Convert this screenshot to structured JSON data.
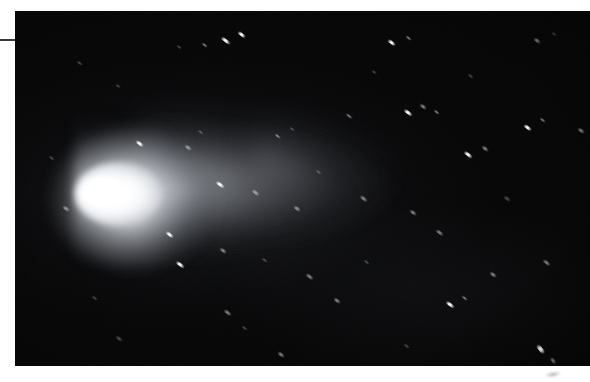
{
  "document": {
    "type": "photograph",
    "subject": "comet",
    "description": "Astronomical photograph of a bright comet with a white coma and a long dust tail extending to the right against a black star field, printed with a white page margin.",
    "background_color": "#ffffff",
    "photo_background_color": "#050506"
  },
  "page": {
    "margin_rule": {
      "label": "",
      "color": "#3a3a3a"
    },
    "corner_smudge": {
      "label": ""
    }
  },
  "photo": {
    "frame": {
      "left": 15,
      "top": 11,
      "width": 575,
      "height": 355
    },
    "comet": {
      "coma_label": "",
      "nucleus_label": "",
      "tail_label": "",
      "coma_color": "#ffffff",
      "tail_color": "#b9bcc3",
      "sky_color": "#050506"
    },
    "stars": [
      {
        "x": 205,
        "y": 28,
        "w": 11,
        "h": 3,
        "rot": 37,
        "cls": ""
      },
      {
        "x": 222,
        "y": 22,
        "w": 9,
        "h": 3,
        "rot": 37,
        "cls": ""
      },
      {
        "x": 186,
        "y": 33,
        "w": 7,
        "h": 2,
        "rot": 37,
        "cls": "dim"
      },
      {
        "x": 161,
        "y": 35,
        "w": 6,
        "h": 2,
        "rot": 37,
        "cls": "faint"
      },
      {
        "x": 372,
        "y": 30,
        "w": 9,
        "h": 3,
        "rot": 37,
        "cls": ""
      },
      {
        "x": 390,
        "y": 26,
        "w": 7,
        "h": 2,
        "rot": 37,
        "cls": "dim"
      },
      {
        "x": 518,
        "y": 28,
        "w": 8,
        "h": 3,
        "rot": 37,
        "cls": "dim"
      },
      {
        "x": 536,
        "y": 22,
        "w": 6,
        "h": 2,
        "rot": 37,
        "cls": "faint"
      },
      {
        "x": 61,
        "y": 51,
        "w": 7,
        "h": 2,
        "rot": 37,
        "cls": "faint"
      },
      {
        "x": 100,
        "y": 74,
        "w": 6,
        "h": 2,
        "rot": 37,
        "cls": "faint"
      },
      {
        "x": 388,
        "y": 100,
        "w": 10,
        "h": 3,
        "rot": 37,
        "cls": ""
      },
      {
        "x": 404,
        "y": 94,
        "w": 8,
        "h": 3,
        "rot": 37,
        "cls": "dim"
      },
      {
        "x": 418,
        "y": 100,
        "w": 7,
        "h": 2,
        "rot": 37,
        "cls": "dim"
      },
      {
        "x": 508,
        "y": 115,
        "w": 9,
        "h": 3,
        "rot": 37,
        "cls": ""
      },
      {
        "x": 524,
        "y": 108,
        "w": 7,
        "h": 2,
        "rot": 37,
        "cls": "dim"
      },
      {
        "x": 562,
        "y": 118,
        "w": 8,
        "h": 3,
        "rot": 37,
        "cls": "dim"
      },
      {
        "x": 120,
        "y": 131,
        "w": 9,
        "h": 3,
        "rot": 37,
        "cls": ""
      },
      {
        "x": 169,
        "y": 135,
        "w": 8,
        "h": 3,
        "rot": 37,
        "cls": "dim"
      },
      {
        "x": 182,
        "y": 120,
        "w": 7,
        "h": 2,
        "rot": 37,
        "cls": "faint"
      },
      {
        "x": 259,
        "y": 124,
        "w": 7,
        "h": 2,
        "rot": 37,
        "cls": "dim"
      },
      {
        "x": 274,
        "y": 117,
        "w": 6,
        "h": 2,
        "rot": 37,
        "cls": "faint"
      },
      {
        "x": 330,
        "y": 104,
        "w": 8,
        "h": 2,
        "rot": 37,
        "cls": "dim"
      },
      {
        "x": 448,
        "y": 142,
        "w": 10,
        "h": 3,
        "rot": 37,
        "cls": ""
      },
      {
        "x": 466,
        "y": 136,
        "w": 8,
        "h": 3,
        "rot": 37,
        "cls": "dim"
      },
      {
        "x": 200,
        "y": 172,
        "w": 10,
        "h": 3,
        "rot": 37,
        "cls": ""
      },
      {
        "x": 236,
        "y": 180,
        "w": 9,
        "h": 3,
        "rot": 37,
        "cls": "dim"
      },
      {
        "x": 278,
        "y": 196,
        "w": 8,
        "h": 3,
        "rot": 37,
        "cls": "dim"
      },
      {
        "x": 300,
        "y": 160,
        "w": 7,
        "h": 2,
        "rot": 37,
        "cls": "faint"
      },
      {
        "x": 344,
        "y": 186,
        "w": 9,
        "h": 3,
        "rot": 37,
        "cls": "dim"
      },
      {
        "x": 394,
        "y": 200,
        "w": 8,
        "h": 3,
        "rot": 37,
        "cls": "dim"
      },
      {
        "x": 420,
        "y": 220,
        "w": 9,
        "h": 3,
        "rot": 37,
        "cls": "dim"
      },
      {
        "x": 488,
        "y": 186,
        "w": 8,
        "h": 3,
        "rot": 37,
        "cls": "faint"
      },
      {
        "x": 150,
        "y": 222,
        "w": 9,
        "h": 3,
        "rot": 37,
        "cls": ""
      },
      {
        "x": 160,
        "y": 252,
        "w": 10,
        "h": 3,
        "rot": 37,
        "cls": ""
      },
      {
        "x": 204,
        "y": 238,
        "w": 8,
        "h": 3,
        "rot": 37,
        "cls": "dim"
      },
      {
        "x": 246,
        "y": 248,
        "w": 7,
        "h": 2,
        "rot": 37,
        "cls": "faint"
      },
      {
        "x": 290,
        "y": 264,
        "w": 9,
        "h": 3,
        "rot": 37,
        "cls": "dim"
      },
      {
        "x": 318,
        "y": 288,
        "w": 8,
        "h": 3,
        "rot": 37,
        "cls": "dim"
      },
      {
        "x": 348,
        "y": 250,
        "w": 7,
        "h": 2,
        "rot": 37,
        "cls": "faint"
      },
      {
        "x": 430,
        "y": 292,
        "w": 10,
        "h": 3,
        "rot": 37,
        "cls": ""
      },
      {
        "x": 446,
        "y": 286,
        "w": 7,
        "h": 2,
        "rot": 37,
        "cls": "dim"
      },
      {
        "x": 474,
        "y": 262,
        "w": 8,
        "h": 3,
        "rot": 37,
        "cls": "dim"
      },
      {
        "x": 527,
        "y": 250,
        "w": 9,
        "h": 3,
        "rot": 37,
        "cls": "dim"
      },
      {
        "x": 520,
        "y": 336,
        "w": 11,
        "h": 4,
        "rot": 50,
        "cls": ""
      },
      {
        "x": 534,
        "y": 348,
        "w": 8,
        "h": 3,
        "rot": 50,
        "cls": "dim"
      },
      {
        "x": 208,
        "y": 300,
        "w": 9,
        "h": 3,
        "rot": 37,
        "cls": "dim"
      },
      {
        "x": 226,
        "y": 316,
        "w": 7,
        "h": 2,
        "rot": 37,
        "cls": "faint"
      },
      {
        "x": 262,
        "y": 342,
        "w": 8,
        "h": 3,
        "rot": 37,
        "cls": "dim"
      },
      {
        "x": 388,
        "y": 334,
        "w": 7,
        "h": 2,
        "rot": 37,
        "cls": "faint"
      },
      {
        "x": 100,
        "y": 326,
        "w": 8,
        "h": 3,
        "rot": 37,
        "cls": "faint"
      },
      {
        "x": 47,
        "y": 196,
        "w": 8,
        "h": 3,
        "rot": 37,
        "cls": "dim"
      },
      {
        "x": 33,
        "y": 146,
        "w": 7,
        "h": 2,
        "rot": 37,
        "cls": "faint"
      },
      {
        "x": 76,
        "y": 286,
        "w": 7,
        "h": 2,
        "rot": 37,
        "cls": "faint"
      },
      {
        "x": 356,
        "y": 60,
        "w": 6,
        "h": 2,
        "rot": 37,
        "cls": "faint"
      },
      {
        "x": 452,
        "y": 64,
        "w": 7,
        "h": 2,
        "rot": 37,
        "cls": "faint"
      }
    ]
  }
}
